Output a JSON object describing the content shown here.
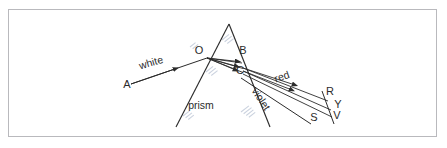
{
  "figure": {
    "title_text": "",
    "background_color": "#ffffff",
    "frame_color": "#b9b9bd",
    "ink_color": "#2b2b2b",
    "artifact_color": "#b9c3d4",
    "point_labels": [
      {
        "id": "A",
        "text": "A",
        "x": 127,
        "y": 88
      },
      {
        "id": "O",
        "text": "O",
        "x": 199,
        "y": 54
      },
      {
        "id": "B",
        "text": "B",
        "x": 243,
        "y": 54
      },
      {
        "id": "C",
        "text": "C",
        "x": 240,
        "y": 74
      },
      {
        "id": "R",
        "text": "R",
        "x": 330,
        "y": 95
      },
      {
        "id": "Y",
        "text": "Y",
        "x": 338,
        "y": 108
      },
      {
        "id": "V",
        "text": "V",
        "x": 337,
        "y": 119
      },
      {
        "id": "S",
        "text": "S",
        "x": 314,
        "y": 121
      }
    ],
    "word_labels": [
      {
        "id": "white",
        "text": "white",
        "x": 152,
        "y": 66,
        "rotation": -16
      },
      {
        "id": "prism",
        "text": "prism",
        "x": 201,
        "y": 109,
        "rotation": 0
      },
      {
        "id": "red",
        "text": "red",
        "x": 283,
        "y": 80,
        "rotation": -19
      },
      {
        "id": "violet",
        "text": "violet",
        "x": 258,
        "y": 101,
        "rotation": 56
      }
    ],
    "geometry": {
      "prism_apex": {
        "x": 229,
        "y": 24
      },
      "prism_bottom_left": {
        "x": 176,
        "y": 127
      },
      "prism_bottom_right": {
        "x": 270,
        "y": 127
      },
      "incident_ray": {
        "from": {
          "x": 131,
          "y": 84
        },
        "to": {
          "x": 207,
          "y": 58
        }
      },
      "entry_point_O": {
        "x": 207,
        "y": 58
      },
      "internal_point_B": {
        "x": 241,
        "y": 60
      },
      "exit_point_C": {
        "x": 243,
        "y": 71
      },
      "exit_R": {
        "x": 328,
        "y": 101
      },
      "exit_Y": {
        "x": 331,
        "y": 110
      },
      "exit_V": {
        "x": 332,
        "y": 117
      },
      "screen_line": {
        "from": {
          "x": 322,
          "y": 91
        },
        "to": {
          "x": 334,
          "y": 124
        }
      }
    },
    "caption_strip": {
      "ray_count": 3,
      "dispersion_order": "red-yellow-violet"
    }
  }
}
